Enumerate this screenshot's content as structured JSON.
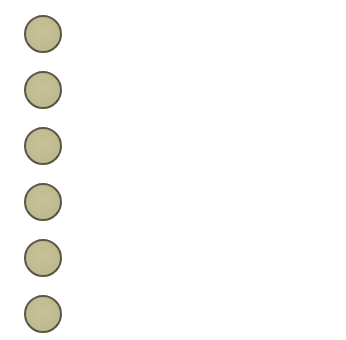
{
  "dots": {
    "count": 6,
    "fill_color": "#c2bc92",
    "border_color": "#5b5649",
    "items": [
      {
        "index": 1
      },
      {
        "index": 2
      },
      {
        "index": 3
      },
      {
        "index": 4
      },
      {
        "index": 5
      },
      {
        "index": 6
      }
    ]
  }
}
